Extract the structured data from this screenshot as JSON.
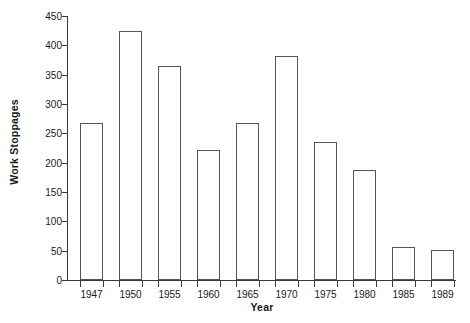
{
  "chart_data": {
    "type": "bar",
    "title": "",
    "subtitle": "",
    "xlabel": "Year",
    "ylabel": "Work Stoppages",
    "categories": [
      "1947",
      "1950",
      "1955",
      "1960",
      "1965",
      "1970",
      "1975",
      "1980",
      "1985",
      "1989"
    ],
    "values": [
      268,
      425,
      365,
      222,
      268,
      382,
      235,
      187,
      57,
      52
    ],
    "series": [
      {
        "name": "Work Stoppages",
        "values": [
          268,
          425,
          365,
          222,
          268,
          382,
          235,
          187,
          57,
          52
        ]
      }
    ],
    "ylim": [
      0,
      450
    ],
    "ytick_values": [
      0,
      50,
      100,
      150,
      200,
      250,
      300,
      350,
      400,
      450
    ],
    "ytick_labels": [
      "0",
      "50",
      "100",
      "150",
      "200",
      "250",
      "300",
      "350",
      "400",
      "450"
    ],
    "grid": false,
    "legend": false,
    "legend_position": "none",
    "bar_fill_color": "#ffffff",
    "bar_edge_color": "#555555",
    "axis_color": "#3a3a3a",
    "text_color": "#1a1a1a",
    "background_color": "#ffffff",
    "annotations": []
  }
}
